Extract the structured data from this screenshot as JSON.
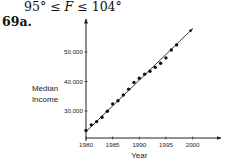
{
  "header": {
    "inequality_left": "95° ≤ ",
    "inequality_var": "F",
    "inequality_right": " ≤ 104°",
    "problem_number": "69a."
  },
  "chart_data": {
    "type": "scatter",
    "title": "",
    "xlabel": "Year",
    "ylabel": "Median Income",
    "ylabel_lines": [
      "Median",
      "Income"
    ],
    "x_ticks": [
      1980,
      1985,
      1990,
      1995,
      2000
    ],
    "x_tick_labels": [
      "1980",
      "1985",
      "1990",
      "1995",
      "2000"
    ],
    "y_ticks": [
      30000,
      40000,
      50000
    ],
    "y_tick_labels": [
      "30,000",
      "40,000",
      "50,000"
    ],
    "xlim": [
      1980,
      2003
    ],
    "ylim": [
      20000,
      56000
    ],
    "grid": false,
    "legend": null,
    "series": [
      {
        "name": "Median Income",
        "x": [
          1980,
          1981,
          1982,
          1983,
          1984,
          1985,
          1986,
          1987,
          1988,
          1989,
          1990,
          1991,
          1992,
          1993,
          1994,
          1995,
          1996,
          1997
        ],
        "values": [
          23400,
          25300,
          26400,
          27900,
          29900,
          32400,
          33500,
          35400,
          37400,
          39700,
          41100,
          42500,
          43500,
          44800,
          46200,
          48000,
          50700,
          52400
        ]
      }
    ],
    "regression_line": {
      "x": [
        1980,
        2000
      ],
      "y": [
        23000,
        57900
      ],
      "arrow_end": true
    },
    "colors": {
      "points": "#111111",
      "line": "#222222",
      "axes": "#222222"
    }
  }
}
